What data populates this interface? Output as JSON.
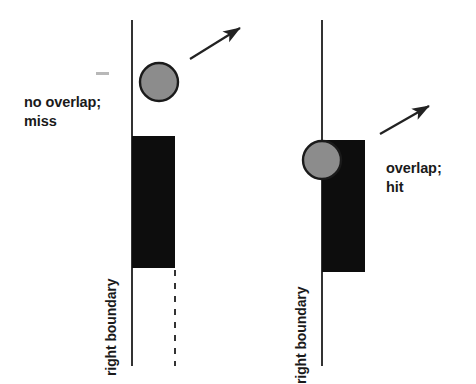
{
  "figure": {
    "type": "diagram",
    "background_color": "#ffffff",
    "width": 476,
    "height": 384
  },
  "style": {
    "line_color": "#333333",
    "rect_fill": "#0d0d0d",
    "circle_fill": "#8c8c8c",
    "circle_stroke": "#1a1a1a",
    "text_color": "#1a1a1a",
    "arrow_color": "#222222"
  },
  "panels": [
    {
      "id": "left",
      "caption_line1": "no overlap;",
      "caption_line2": "miss",
      "boundary_label": "right boundary",
      "boundary_line": {
        "x": 132,
        "y_top": 20,
        "y_bottom": 366
      },
      "dashed_line": {
        "x": 175,
        "y_top": 270,
        "y_bottom": 366
      },
      "rect": {
        "x": 132,
        "y": 136,
        "width": 43,
        "height": 132
      },
      "circle": {
        "cx": 159,
        "cy": 82,
        "r": 19
      },
      "arrow": {
        "x1": 190,
        "y1": 59,
        "x2": 243,
        "y2": 26
      }
    },
    {
      "id": "right",
      "caption_line1": "overlap;",
      "caption_line2": "hit",
      "boundary_label": "right boundary",
      "boundary_line": {
        "x": 322,
        "y_top": 20,
        "y_bottom": 366
      },
      "dashed_line": null,
      "rect": {
        "x": 322,
        "y": 140,
        "width": 43,
        "height": 132
      },
      "circle": {
        "cx": 322,
        "cy": 160,
        "r": 19
      },
      "arrow": {
        "x1": 380,
        "y1": 134,
        "x2": 432,
        "y2": 104
      }
    }
  ],
  "artifacts": [
    {
      "name": "scan-speck",
      "x": 96,
      "y": 72,
      "width": 13,
      "height": 3
    }
  ]
}
